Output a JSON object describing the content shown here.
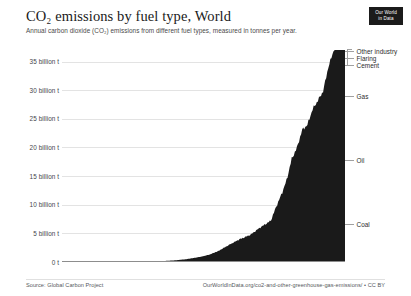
{
  "header": {
    "title": "CO₂ emissions by fuel type, World",
    "subtitle": "Annual carbon dioxide (CO₂) emissions from different fuel types, measured in tonnes per year.",
    "logo_line1": "Our World",
    "logo_line2": "in Data"
  },
  "footer": {
    "source": "Source: Global Carbon Project",
    "link": "OurWorldInData.org/co2-and-other-greenhouse-gas-emissions/ • CC BY"
  },
  "legend": {
    "items": [
      {
        "label": "Other industry",
        "top": 3
      },
      {
        "label": "Flaring",
        "top": 10
      },
      {
        "label": "Cement",
        "top": 17
      },
      {
        "label": "Gas",
        "top": 48
      },
      {
        "label": "Oil",
        "top": 112
      },
      {
        "label": "Coal",
        "top": 176
      }
    ]
  },
  "chart_data": {
    "type": "area",
    "stacked": true,
    "title": "CO₂ emissions by fuel type, World",
    "subtitle": "Annual carbon dioxide (CO₂) emissions from different fuel types, measured in tonnes per year.",
    "xlabel": "",
    "ylabel": "",
    "xlim": [
      1750,
      2021
    ],
    "ylim": [
      0,
      37
    ],
    "grid": true,
    "legend_position": "right",
    "series_color": "#1a1a1a",
    "y_ticks": [
      {
        "value": 0,
        "label": "0 t"
      },
      {
        "value": 5,
        "label": "5 billion t"
      },
      {
        "value": 10,
        "label": "10 billion t"
      },
      {
        "value": 15,
        "label": "15 billion t"
      },
      {
        "value": 20,
        "label": "20 billion t"
      },
      {
        "value": 25,
        "label": "25 billion t"
      },
      {
        "value": 30,
        "label": "30 billion t"
      },
      {
        "value": 35,
        "label": "35 billion t"
      }
    ],
    "x_ticks": [
      {
        "value": 1750,
        "label": "1750"
      },
      {
        "value": 1800,
        "label": "1800"
      },
      {
        "value": 1850,
        "label": "1850"
      },
      {
        "value": 1900,
        "label": "1900"
      },
      {
        "value": 1950,
        "label": "1950"
      },
      {
        "value": 2020,
        "label": "2020"
      }
    ],
    "x": [
      1750,
      1760,
      1770,
      1780,
      1790,
      1800,
      1810,
      1820,
      1830,
      1840,
      1850,
      1860,
      1870,
      1880,
      1890,
      1900,
      1910,
      1920,
      1930,
      1940,
      1950,
      1955,
      1960,
      1965,
      1970,
      1975,
      1980,
      1985,
      1990,
      1995,
      2000,
      2005,
      2010,
      2015,
      2019,
      2020,
      2021
    ],
    "series": [
      {
        "name": "Coal",
        "values": [
          0.01,
          0.01,
          0.01,
          0.02,
          0.02,
          0.03,
          0.05,
          0.07,
          0.1,
          0.15,
          0.2,
          0.3,
          0.5,
          0.75,
          1.1,
          1.7,
          2.4,
          2.9,
          3.1,
          3.9,
          4.2,
          5.3,
          5.8,
          6.1,
          6.6,
          7.2,
          8.3,
          9.1,
          9.9,
          10.2,
          10.5,
          12.8,
          14.6,
          14.9,
          14.7,
          14.2,
          14.8
        ]
      },
      {
        "name": "Oil",
        "values": [
          0,
          0,
          0,
          0,
          0,
          0,
          0,
          0,
          0,
          0,
          0,
          0.01,
          0.02,
          0.05,
          0.1,
          0.2,
          0.5,
          0.9,
          1.3,
          1.7,
          2.2,
          3.1,
          4.2,
          5.6,
          7.8,
          8.6,
          9.8,
          9.4,
          10.3,
          11.0,
          11.7,
          12.4,
          12.5,
          13.3,
          13.8,
          12.0,
          12.8
        ]
      },
      {
        "name": "Gas",
        "values": [
          0,
          0,
          0,
          0,
          0,
          0,
          0,
          0,
          0,
          0,
          0,
          0,
          0,
          0,
          0.01,
          0.02,
          0.06,
          0.1,
          0.2,
          0.3,
          0.6,
          0.9,
          1.3,
          1.9,
          2.8,
          3.2,
          3.9,
          4.3,
          5.2,
          5.6,
          6.1,
          6.9,
          7.5,
          7.9,
          8.4,
          8.2,
          8.6
        ]
      },
      {
        "name": "Cement",
        "values": [
          0,
          0,
          0,
          0,
          0,
          0,
          0,
          0,
          0,
          0,
          0,
          0,
          0,
          0.01,
          0.01,
          0.02,
          0.03,
          0.04,
          0.06,
          0.08,
          0.1,
          0.15,
          0.2,
          0.3,
          0.4,
          0.5,
          0.6,
          0.7,
          0.8,
          0.9,
          1.0,
          1.3,
          1.6,
          1.6,
          1.7,
          1.7,
          1.7
        ]
      },
      {
        "name": "Flaring",
        "values": [
          0,
          0,
          0,
          0,
          0,
          0,
          0,
          0,
          0,
          0,
          0,
          0,
          0,
          0,
          0,
          0,
          0.01,
          0.02,
          0.03,
          0.05,
          0.08,
          0.12,
          0.18,
          0.24,
          0.3,
          0.32,
          0.3,
          0.28,
          0.26,
          0.25,
          0.24,
          0.26,
          0.3,
          0.34,
          0.36,
          0.34,
          0.36
        ]
      },
      {
        "name": "Other industry",
        "values": [
          0,
          0,
          0,
          0,
          0,
          0,
          0,
          0,
          0,
          0,
          0,
          0,
          0,
          0,
          0,
          0,
          0,
          0,
          0.01,
          0.02,
          0.03,
          0.04,
          0.05,
          0.07,
          0.1,
          0.12,
          0.15,
          0.17,
          0.2,
          0.22,
          0.25,
          0.3,
          0.35,
          0.38,
          0.4,
          0.4,
          0.42
        ]
      }
    ],
    "totals_note": "Stacked total peaks near 37 billion tonnes around 2019"
  }
}
